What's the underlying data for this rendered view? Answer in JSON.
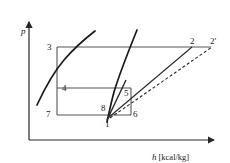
{
  "figure": {
    "type": "thermodynamic-ph-diagram",
    "axes": {
      "y_label": "p",
      "x_label_symbol": "h",
      "x_label_unit": "[kcal/kg]",
      "x_axis_full": "h [kcal/kg]"
    },
    "colors": {
      "line": "#262626",
      "curve": "#1a1a1a",
      "background": "#ffffff",
      "text": "#1a1a1a"
    },
    "state_points": [
      {
        "id": "p3",
        "label": "3",
        "x": 47,
        "y": 43
      },
      {
        "id": "p4",
        "label": "4",
        "x": 62,
        "y": 84
      },
      {
        "id": "p7",
        "label": "7",
        "x": 46,
        "y": 110
      },
      {
        "id": "p8",
        "label": "8",
        "x": 101,
        "y": 104
      },
      {
        "id": "p1",
        "label": "1",
        "x": 105,
        "y": 120
      },
      {
        "id": "p5",
        "label": "5",
        "x": 124,
        "y": 89
      },
      {
        "id": "p6",
        "label": "6",
        "x": 133,
        "y": 110
      },
      {
        "id": "p2",
        "label": "2",
        "x": 190,
        "y": 37
      },
      {
        "id": "p2p",
        "label": "2′",
        "x": 210,
        "y": 37
      }
    ]
  }
}
